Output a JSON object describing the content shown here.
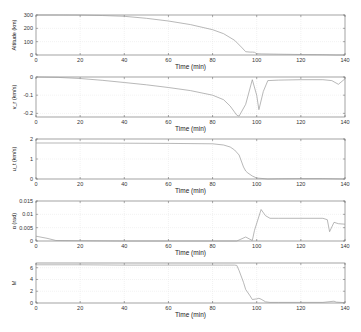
{
  "chart_data": [
    {
      "type": "line",
      "title": "",
      "xlabel": "Time (min)",
      "ylabel": "Altitude (km)",
      "xlim": [
        0,
        140
      ],
      "ylim": [
        0,
        300
      ],
      "xticks": [
        0,
        20,
        40,
        60,
        80,
        100,
        120,
        140
      ],
      "yticks": [
        0,
        100,
        200,
        300
      ],
      "ytick_labels": [
        "0",
        "100",
        "200",
        "300"
      ],
      "grid": true,
      "series": [
        {
          "name": "Altitude",
          "x": [
            0,
            10,
            20,
            30,
            40,
            50,
            60,
            70,
            80,
            85,
            90,
            93,
            95,
            97,
            98,
            99,
            100,
            102,
            110,
            120,
            130,
            136,
            140
          ],
          "values": [
            300,
            300,
            299,
            296,
            290,
            275,
            255,
            228,
            190,
            160,
            110,
            60,
            25,
            22,
            22,
            20,
            10,
            8,
            6,
            4,
            2,
            0,
            0
          ]
        }
      ]
    },
    {
      "type": "line",
      "title": "",
      "xlabel": "Time (min)",
      "ylabel": "v_r (km/s)",
      "xlim": [
        0,
        140
      ],
      "ylim": [
        -0.22,
        0
      ],
      "xticks": [
        0,
        20,
        40,
        60,
        80,
        100,
        120,
        140
      ],
      "yticks": [
        -0.2,
        -0.1,
        0
      ],
      "ytick_labels": [
        "-0.2",
        "-0.1",
        "0"
      ],
      "grid": true,
      "series": [
        {
          "name": "Radial velocity",
          "x": [
            0,
            10,
            20,
            30,
            40,
            50,
            60,
            70,
            80,
            85,
            88,
            91,
            92,
            95,
            98,
            100,
            101,
            103,
            105,
            110,
            120,
            130,
            134,
            137,
            140
          ],
          "values": [
            0,
            -0.002,
            -0.008,
            -0.018,
            -0.03,
            -0.043,
            -0.058,
            -0.075,
            -0.1,
            -0.125,
            -0.16,
            -0.21,
            -0.215,
            -0.15,
            -0.015,
            -0.1,
            -0.18,
            -0.08,
            -0.02,
            -0.017,
            -0.015,
            -0.015,
            -0.02,
            -0.04,
            -0.01
          ]
        }
      ]
    },
    {
      "type": "line",
      "title": "",
      "xlabel": "Time (min)",
      "ylabel": "u_t (km/s)",
      "xlim": [
        0,
        140
      ],
      "ylim": [
        0,
        2
      ],
      "xticks": [
        0,
        20,
        40,
        60,
        80,
        100,
        120,
        140
      ],
      "yticks": [
        0,
        1,
        2
      ],
      "ytick_labels": [
        "0",
        "1",
        "2"
      ],
      "grid": true,
      "series": [
        {
          "name": "Tangential velocity",
          "x": [
            0,
            20,
            40,
            60,
            80,
            85,
            88,
            90,
            92,
            93,
            94,
            95,
            96,
            98,
            100,
            105,
            110,
            120,
            130,
            140
          ],
          "values": [
            1.8,
            1.8,
            1.79,
            1.78,
            1.76,
            1.7,
            1.6,
            1.45,
            1.2,
            0.9,
            0.6,
            0.4,
            0.3,
            0.15,
            0.05,
            0.0,
            0.01,
            0.02,
            0.02,
            0.0
          ]
        }
      ]
    },
    {
      "type": "line",
      "title": "",
      "xlabel": "Time (min)",
      "ylabel": "α (rad)",
      "xlim": [
        0,
        140
      ],
      "ylim": [
        0,
        0.015
      ],
      "xticks": [
        0,
        20,
        40,
        60,
        80,
        100,
        120,
        140
      ],
      "yticks": [
        0,
        0.005,
        0.01,
        0.015
      ],
      "ytick_labels": [
        "0",
        "0.005",
        "0.01",
        "0.015"
      ],
      "grid": true,
      "series": [
        {
          "name": "Angle of attack",
          "x": [
            0,
            5,
            9,
            20,
            40,
            60,
            80,
            91,
            95,
            98,
            99,
            102,
            104,
            106,
            110,
            120,
            130,
            132,
            133,
            135,
            137,
            140
          ],
          "values": [
            0.0018,
            0.001,
            0.0002,
            0.0001,
            0,
            0,
            0,
            0,
            0.0015,
            0.0002,
            0.004,
            0.0118,
            0.0095,
            0.0085,
            0.0085,
            0.0085,
            0.0085,
            0.008,
            0.0035,
            0.007,
            0.0065,
            0.0063
          ]
        }
      ]
    },
    {
      "type": "line",
      "title": "",
      "xlabel": "Time (min)",
      "ylabel": "M",
      "xlim": [
        0,
        140
      ],
      "ylim": [
        0,
        6.8
      ],
      "xticks": [
        0,
        20,
        40,
        60,
        80,
        100,
        120,
        140
      ],
      "yticks": [
        0,
        2,
        4,
        6
      ],
      "ytick_labels": [
        "0",
        "2",
        "4",
        "6"
      ],
      "grid": true,
      "series": [
        {
          "name": "Mach number",
          "x": [
            0,
            20,
            40,
            60,
            80,
            85,
            90,
            91,
            92,
            94,
            95,
            97,
            98,
            100,
            101,
            102,
            104,
            106,
            110,
            120,
            130,
            135,
            136,
            140
          ],
          "values": [
            6.5,
            6.5,
            6.45,
            6.45,
            6.45,
            6.45,
            6.45,
            6.4,
            5.5,
            3.5,
            2.3,
            1.2,
            0.6,
            0.7,
            0.8,
            0.65,
            0.2,
            0.1,
            0.1,
            0.1,
            0.1,
            0.3,
            0.15,
            0.05
          ]
        }
      ]
    }
  ]
}
